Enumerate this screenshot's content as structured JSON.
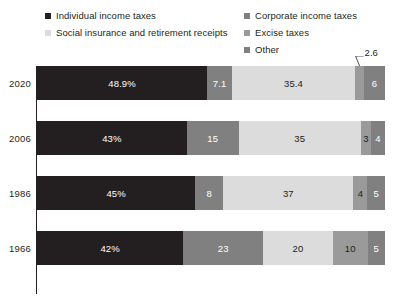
{
  "legend": {
    "columns": [
      {
        "items": [
          {
            "label": "Individual income taxes",
            "color": "#231f20",
            "key": "individual"
          },
          {
            "label": "Social insurance and retirement receipts",
            "color": "#dcdcdc",
            "key": "social"
          }
        ]
      },
      {
        "items": [
          {
            "label": "Corporate income taxes",
            "color": "#808080",
            "key": "corporate"
          },
          {
            "label": "Excise taxes",
            "color": "#9a9a9a",
            "key": "excise"
          },
          {
            "label": "Other",
            "color": "#808080",
            "key": "other"
          }
        ]
      }
    ]
  },
  "callout": {
    "value": "2.6",
    "row": "2020",
    "series": "excise"
  },
  "chart_data": {
    "type": "bar",
    "orientation": "horizontal",
    "stacked": true,
    "normalized": true,
    "title": "",
    "subtitle": "",
    "xlabel": "",
    "ylabel": "",
    "grid": false,
    "legend_position": "top",
    "categories": [
      "2020",
      "2006",
      "1986",
      "1966"
    ],
    "series": [
      {
        "name": "Individual income taxes",
        "key": "individual",
        "color": "#231f20",
        "text_color": "#ffffff",
        "values": [
          48.9,
          43,
          45,
          42
        ],
        "labels": [
          "48.9%",
          "43%",
          "45%",
          "42%"
        ]
      },
      {
        "name": "Corporate income taxes",
        "key": "corporate",
        "color": "#808080",
        "text_color": "#ffffff",
        "values": [
          7.1,
          15,
          8,
          23
        ],
        "labels": [
          "7.1",
          "15",
          "8",
          "23"
        ]
      },
      {
        "name": "Social insurance and retirement receipts",
        "key": "social",
        "color": "#dcdcdc",
        "text_color": "#231f20",
        "values": [
          35.4,
          35,
          37,
          20
        ],
        "labels": [
          "35.4",
          "35",
          "37",
          "20"
        ]
      },
      {
        "name": "Excise taxes",
        "key": "excise",
        "color": "#9a9a9a",
        "text_color": "#231f20",
        "values": [
          2.6,
          3,
          4,
          10
        ],
        "labels": [
          "",
          "3",
          "4",
          "10"
        ]
      },
      {
        "name": "Other",
        "key": "other",
        "color": "#808080",
        "text_color": "#ffffff",
        "values": [
          6,
          4,
          5,
          5
        ],
        "labels": [
          "6",
          "4",
          "5",
          "5"
        ]
      }
    ]
  }
}
